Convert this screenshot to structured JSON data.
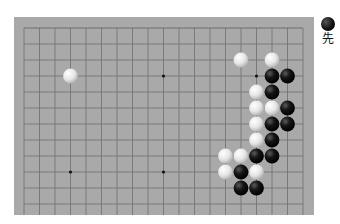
{
  "board": {
    "size": 19,
    "visible_rows": 12,
    "colors": {
      "background": "#a9a9a9",
      "line": "#6e6e6e",
      "star": "#111111"
    },
    "star_points": [
      [
        3,
        3
      ],
      [
        9,
        3
      ],
      [
        15,
        3
      ],
      [
        3,
        9
      ],
      [
        9,
        9
      ],
      [
        15,
        9
      ]
    ],
    "stones": [
      {
        "color": "white",
        "col": 3,
        "row": 3
      },
      {
        "color": "white",
        "col": 14,
        "row": 2
      },
      {
        "color": "white",
        "col": 16,
        "row": 2
      },
      {
        "color": "black",
        "col": 16,
        "row": 3
      },
      {
        "color": "black",
        "col": 17,
        "row": 3
      },
      {
        "color": "white",
        "col": 15,
        "row": 4
      },
      {
        "color": "black",
        "col": 16,
        "row": 4
      },
      {
        "color": "white",
        "col": 15,
        "row": 5
      },
      {
        "color": "white",
        "col": 16,
        "row": 5
      },
      {
        "color": "black",
        "col": 17,
        "row": 5
      },
      {
        "color": "white",
        "col": 15,
        "row": 6
      },
      {
        "color": "black",
        "col": 16,
        "row": 6
      },
      {
        "color": "black",
        "col": 17,
        "row": 6
      },
      {
        "color": "white",
        "col": 15,
        "row": 7
      },
      {
        "color": "black",
        "col": 16,
        "row": 7
      },
      {
        "color": "white",
        "col": 13,
        "row": 8
      },
      {
        "color": "white",
        "col": 14,
        "row": 8
      },
      {
        "color": "black",
        "col": 15,
        "row": 8
      },
      {
        "color": "black",
        "col": 16,
        "row": 8
      },
      {
        "color": "white",
        "col": 13,
        "row": 9
      },
      {
        "color": "black",
        "col": 14,
        "row": 9
      },
      {
        "color": "white",
        "col": 15,
        "row": 9
      },
      {
        "color": "black",
        "col": 14,
        "row": 10
      },
      {
        "color": "black",
        "col": 15,
        "row": 10
      }
    ]
  },
  "turn": {
    "stone": "black",
    "label": "先"
  }
}
